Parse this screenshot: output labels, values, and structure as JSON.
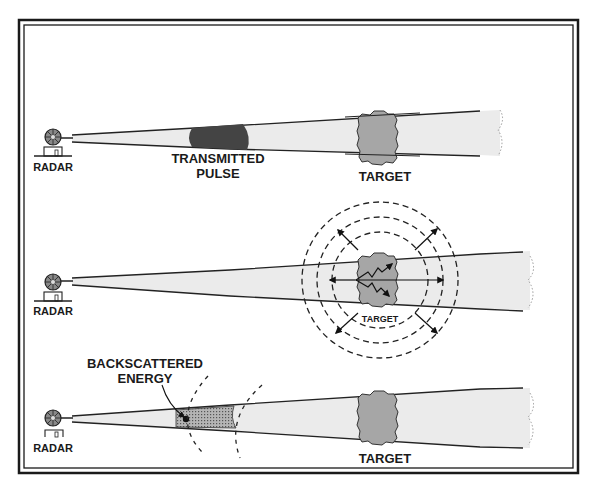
{
  "diagram": {
    "colors": {
      "frame": "#1a1a1a",
      "beam_fill": "#ebebeb",
      "beam_edge": "#222222",
      "pulse_dark": "#444444",
      "target_fill": "#a6a6a6",
      "backscatter_fill": "#8c8c8c",
      "text": "#1a1a1a"
    },
    "panels": [
      {
        "id": "panel-1",
        "stage": "pulse transmitted toward target",
        "radar_label": "RADAR",
        "pulse_label_line1": "TRANSMITTED",
        "pulse_label_line2": "PULSE",
        "target_label": "TARGET"
      },
      {
        "id": "panel-2",
        "stage": "pulse strikes target and scatters in all directions",
        "radar_label": "RADAR",
        "target_label": "TARGET"
      },
      {
        "id": "panel-3",
        "stage": "backscattered energy returns to radar",
        "radar_label": "RADAR",
        "backscatter_label_line1": "BACKSCATTERED",
        "backscatter_label_line2": "ENERGY",
        "target_label": "TARGET"
      }
    ],
    "icons": {
      "radar": "radar-dish-icon",
      "target": "target-cloud-icon",
      "scatter_arrows": "arrow-icon",
      "wavefront": "dashed-wavefront-icon"
    }
  }
}
